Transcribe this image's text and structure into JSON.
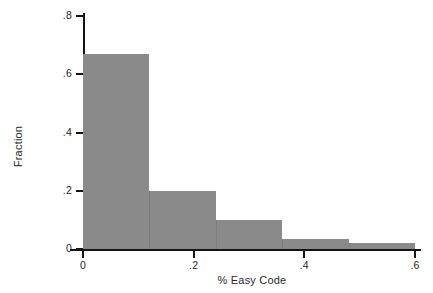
{
  "chart": {
    "type": "bar",
    "title": "",
    "xlabel": "% Easy Code",
    "ylabel": "Fraction",
    "y_ticks": [
      "0",
      ".2",
      ".4",
      ".6",
      ".8"
    ],
    "x_ticks": [
      "0",
      ".2",
      ".4",
      ".6"
    ],
    "bar_color": "#8a8a8a",
    "axis_color": "#141414",
    "background": "#ffffff"
  },
  "chart_data": {
    "type": "bar",
    "title": "",
    "xlabel": "% Easy Code",
    "ylabel": "Fraction",
    "xlim": [
      0,
      0.6
    ],
    "ylim": [
      0,
      0.8
    ],
    "xticks": [
      0,
      0.2,
      0.4,
      0.6
    ],
    "xtick_labels": [
      "0",
      ".2",
      ".4",
      ".6"
    ],
    "yticks": [
      0,
      0.2,
      0.4,
      0.6,
      0.8
    ],
    "ytick_labels": [
      "0",
      ".2",
      ".4",
      ".6",
      ".8"
    ],
    "grid": false,
    "legend": false,
    "bins": [
      {
        "x0": 0.0,
        "x1": 0.12,
        "value": 0.67
      },
      {
        "x0": 0.12,
        "x1": 0.24,
        "value": 0.2
      },
      {
        "x0": 0.24,
        "x1": 0.36,
        "value": 0.1
      },
      {
        "x0": 0.36,
        "x1": 0.48,
        "value": 0.035
      },
      {
        "x0": 0.48,
        "x1": 0.6,
        "value": 0.02
      }
    ],
    "categories": [
      "0-0.12",
      "0.12-0.24",
      "0.24-0.36",
      "0.36-0.48",
      "0.48-0.60"
    ],
    "values": [
      0.67,
      0.2,
      0.1,
      0.035,
      0.02
    ]
  }
}
